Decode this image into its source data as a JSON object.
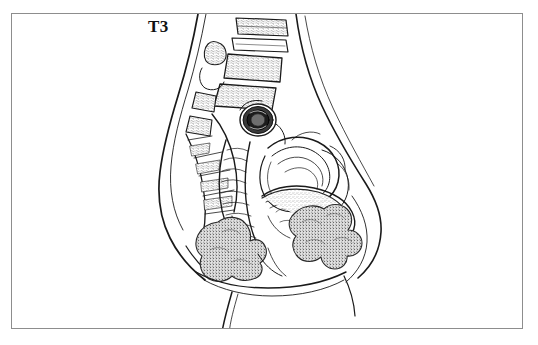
{
  "figure": {
    "title": "T3",
    "domain_note": "Sagittal section of the female pelvis, line drawing",
    "background_color": "#ffffff",
    "ink_color": "#1a1a1a",
    "frame_color": "#8d8d8d",
    "frame": {
      "x": 11,
      "y": 13,
      "width": 512,
      "height": 316,
      "border_width": 1
    }
  },
  "label": {
    "text": "T3",
    "x": 148,
    "y": 18,
    "font_size": 17,
    "font_weight": "bold",
    "color": "#111111"
  },
  "structures": [
    {
      "name": "body-contour-back",
      "kind": "outline",
      "description": "posterior trunk and buttock contour"
    },
    {
      "name": "body-contour-abdomen",
      "kind": "outline",
      "description": "anterior abdominal wall contour"
    },
    {
      "name": "lumbar-vertebrae",
      "kind": "bone",
      "description": "stacked lumbar vertebral bodies with trabecular stipple"
    },
    {
      "name": "sacrum",
      "kind": "bone",
      "description": "sacral curve with segment lines"
    },
    {
      "name": "coccyx",
      "kind": "bone",
      "description": "small terminal bone segment"
    },
    {
      "name": "spinous-process",
      "kind": "bone",
      "description": "isolated posterior bone fragment"
    },
    {
      "name": "vessel-cross-section",
      "kind": "vessel",
      "description": "dark concentric oval ring, cut vessel"
    },
    {
      "name": "rectum",
      "kind": "organ",
      "description": "vertical tube with transverse haustral folds"
    },
    {
      "name": "uterus",
      "kind": "organ",
      "description": "pear-shaped curved body with layered wall"
    },
    {
      "name": "bladder",
      "kind": "organ",
      "description": "anterior chamber with mucosal wall lines"
    },
    {
      "name": "bowel-loops",
      "kind": "organ",
      "description": "coiled loops with stippled mucosa"
    },
    {
      "name": "tumor-mass-left",
      "kind": "tumor",
      "description": "irregular lobulated stippled mass, posterior"
    },
    {
      "name": "tumor-mass-right",
      "kind": "tumor",
      "description": "irregular lobulated stippled mass, anterior"
    },
    {
      "name": "pelvic-floor",
      "kind": "soft-tissue",
      "description": "perineal and thigh contour lines"
    }
  ],
  "legend": {
    "stipple_fill": "dense dot texture indicating tumor",
    "line_only": "normal anatomy rendered as contour lines"
  }
}
